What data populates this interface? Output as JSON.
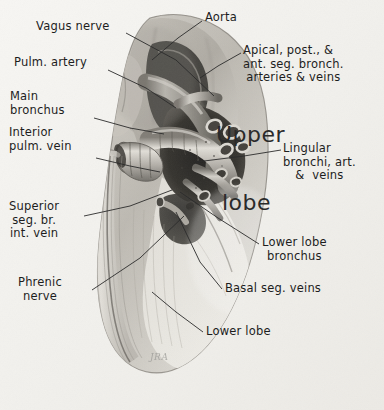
{
  "figure": {
    "width": 384,
    "height": 410,
    "background_color": "#f3f2ef",
    "ink_color": "#1d1d1d",
    "style": "grayscale pencil and wash medical illustration",
    "signature": "JRA"
  },
  "overlay_labels": [
    {
      "name": "upper",
      "text": "Upper",
      "x": 216,
      "y": 122
    },
    {
      "name": "lobe",
      "text": "lobe",
      "x": 222,
      "y": 190
    }
  ],
  "labels": [
    {
      "name": "vagus-nerve",
      "lines": [
        "Vagus nerve"
      ],
      "x": 36,
      "y": 20,
      "align": "left",
      "leader": [
        [
          126,
          33
        ],
        [
          176,
          60
        ],
        [
          214,
          96
        ]
      ]
    },
    {
      "name": "aorta",
      "lines": [
        "Aorta"
      ],
      "x": 205,
      "y": 11,
      "align": "left",
      "leader": [
        [
          202,
          21
        ],
        [
          178,
          38
        ],
        [
          152,
          60
        ]
      ]
    },
    {
      "name": "apical-post-ant-seg-bronch-arteries-veins",
      "lines": [
        "Apical, post., &",
        "ant. seg. bronch.",
        "arteries & veins"
      ],
      "x": 243,
      "y": 44,
      "align": "left",
      "leader": [
        [
          241,
          53
        ],
        [
          218,
          66
        ],
        [
          200,
          78
        ]
      ]
    },
    {
      "name": "pulm-artery",
      "lines": [
        "Pulm. artery"
      ],
      "x": 14,
      "y": 56,
      "align": "left",
      "leader": [
        [
          108,
          70
        ],
        [
          146,
          88
        ],
        [
          176,
          108
        ]
      ]
    },
    {
      "name": "main-bronchus",
      "lines": [
        "Main",
        "bronchus"
      ],
      "x": 10,
      "y": 90,
      "align": "left",
      "leader": [
        [
          94,
          118
        ],
        [
          130,
          128
        ],
        [
          164,
          134
        ]
      ]
    },
    {
      "name": "interior-pulm-vein",
      "lines": [
        "Interior",
        "pulm. vein"
      ],
      "x": 9,
      "y": 126,
      "align": "left",
      "leader": [
        [
          96,
          158
        ],
        [
          130,
          166
        ],
        [
          160,
          172
        ]
      ]
    },
    {
      "name": "lingular-bronchi-art-veins",
      "lines": [
        "Lingular",
        "bronchi, art.",
        "&  veins"
      ],
      "x": 283,
      "y": 142,
      "align": "left",
      "leader": [
        [
          281,
          150
        ],
        [
          244,
          156
        ],
        [
          196,
          162
        ]
      ]
    },
    {
      "name": "superior-seg-br-int-vein",
      "lines": [
        "Superior",
        "seg. br.",
        "int. vein"
      ],
      "x": 9,
      "y": 200,
      "align": "left",
      "leader": [
        [
          84,
          216
        ],
        [
          130,
          206
        ],
        [
          172,
          190
        ]
      ]
    },
    {
      "name": "lower-lobe-bronchus",
      "lines": [
        "Lower lobe",
        "bronchus"
      ],
      "x": 262,
      "y": 236,
      "align": "left",
      "leader": [
        [
          259,
          244
        ],
        [
          218,
          218
        ],
        [
          180,
          192
        ]
      ]
    },
    {
      "name": "basal-seg-veins",
      "lines": [
        "Basal seg. veins"
      ],
      "x": 225,
      "y": 282,
      "align": "left",
      "leader": [
        [
          222,
          289
        ],
        [
          200,
          262
        ],
        [
          176,
          212
        ]
      ]
    },
    {
      "name": "phrenic-nerve",
      "lines": [
        "Phrenic",
        "nerve"
      ],
      "x": 18,
      "y": 276,
      "align": "left",
      "leader": [
        [
          92,
          290
        ],
        [
          140,
          258
        ],
        [
          184,
          216
        ]
      ]
    },
    {
      "name": "lower-lobe",
      "lines": [
        "Lower lobe"
      ],
      "x": 206,
      "y": 325,
      "align": "left",
      "leader": [
        [
          203,
          332
        ],
        [
          176,
          312
        ],
        [
          152,
          292
        ]
      ]
    }
  ]
}
